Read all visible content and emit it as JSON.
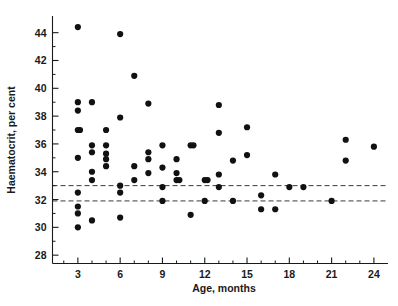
{
  "chart_data": {
    "type": "scatter",
    "title": "",
    "xlabel": "Age, months",
    "ylabel": "Haematocrit, per cent",
    "xlim": [
      1.2,
      25.0
    ],
    "ylim": [
      27.4,
      45.2
    ],
    "grid": false,
    "legend": "none",
    "xticks": [
      3,
      6,
      9,
      12,
      15,
      18,
      21,
      24
    ],
    "xticklabels": [
      "3",
      "6",
      "9",
      "12",
      "15",
      "18",
      "21",
      "24"
    ],
    "xminorticks": [
      2,
      4,
      5,
      7,
      8,
      10,
      11,
      13,
      14,
      16,
      17,
      19,
      20,
      22,
      23
    ],
    "yticks": [
      28,
      30,
      32,
      34,
      36,
      38,
      40,
      42,
      44
    ],
    "yticklabels": [
      "28",
      "30",
      "32",
      "34",
      "36",
      "38",
      "40",
      "42",
      "44"
    ],
    "yminorticks": [
      29,
      31,
      33,
      35,
      37,
      39,
      41,
      43
    ],
    "reference_lines": [
      {
        "name": "upper-reference-line",
        "y": 33.0,
        "style": "dashed"
      },
      {
        "name": "lower-reference-line",
        "y": 31.9,
        "style": "dashed"
      }
    ],
    "marker": {
      "shape": "circle",
      "color": "#111111",
      "size": 3.1
    },
    "points": [
      {
        "x": 3.0,
        "y": 44.4
      },
      {
        "x": 3.0,
        "y": 39.0
      },
      {
        "x": 3.0,
        "y": 38.4
      },
      {
        "x": 3.0,
        "y": 37.0
      },
      {
        "x": 3.15,
        "y": 37.0
      },
      {
        "x": 3.0,
        "y": 35.0
      },
      {
        "x": 3.0,
        "y": 32.5
      },
      {
        "x": 3.0,
        "y": 31.5
      },
      {
        "x": 3.0,
        "y": 31.0
      },
      {
        "x": 3.0,
        "y": 30.0
      },
      {
        "x": 4.0,
        "y": 39.0
      },
      {
        "x": 4.0,
        "y": 35.9
      },
      {
        "x": 4.0,
        "y": 35.4
      },
      {
        "x": 4.0,
        "y": 34.0
      },
      {
        "x": 4.0,
        "y": 33.4
      },
      {
        "x": 4.0,
        "y": 30.5
      },
      {
        "x": 5.0,
        "y": 37.0
      },
      {
        "x": 5.0,
        "y": 35.9
      },
      {
        "x": 5.0,
        "y": 35.3
      },
      {
        "x": 5.0,
        "y": 34.9
      },
      {
        "x": 5.0,
        "y": 34.4
      },
      {
        "x": 6.0,
        "y": 43.9
      },
      {
        "x": 6.0,
        "y": 37.9
      },
      {
        "x": 6.0,
        "y": 33.0
      },
      {
        "x": 6.0,
        "y": 32.5
      },
      {
        "x": 6.0,
        "y": 30.7
      },
      {
        "x": 7.0,
        "y": 40.9
      },
      {
        "x": 7.0,
        "y": 34.4
      },
      {
        "x": 7.0,
        "y": 33.4
      },
      {
        "x": 8.0,
        "y": 38.9
      },
      {
        "x": 8.0,
        "y": 35.4
      },
      {
        "x": 8.0,
        "y": 34.9
      },
      {
        "x": 8.0,
        "y": 33.9
      },
      {
        "x": 9.0,
        "y": 35.9
      },
      {
        "x": 9.0,
        "y": 34.3
      },
      {
        "x": 9.0,
        "y": 32.9
      },
      {
        "x": 9.0,
        "y": 31.9
      },
      {
        "x": 10.0,
        "y": 34.9
      },
      {
        "x": 10.0,
        "y": 33.9
      },
      {
        "x": 10.0,
        "y": 33.4
      },
      {
        "x": 10.2,
        "y": 33.4
      },
      {
        "x": 11.0,
        "y": 35.9
      },
      {
        "x": 11.2,
        "y": 35.9
      },
      {
        "x": 11.0,
        "y": 30.9
      },
      {
        "x": 12.0,
        "y": 33.4
      },
      {
        "x": 12.2,
        "y": 33.4
      },
      {
        "x": 12.0,
        "y": 31.9
      },
      {
        "x": 13.0,
        "y": 38.8
      },
      {
        "x": 13.0,
        "y": 36.8
      },
      {
        "x": 13.0,
        "y": 33.8
      },
      {
        "x": 13.0,
        "y": 32.9
      },
      {
        "x": 14.0,
        "y": 34.8
      },
      {
        "x": 14.0,
        "y": 31.9
      },
      {
        "x": 15.0,
        "y": 37.2
      },
      {
        "x": 15.0,
        "y": 35.2
      },
      {
        "x": 16.0,
        "y": 32.3
      },
      {
        "x": 16.0,
        "y": 31.3
      },
      {
        "x": 17.0,
        "y": 33.8
      },
      {
        "x": 17.0,
        "y": 31.3
      },
      {
        "x": 18.0,
        "y": 32.9
      },
      {
        "x": 19.0,
        "y": 32.9
      },
      {
        "x": 21.0,
        "y": 31.9
      },
      {
        "x": 22.0,
        "y": 36.3
      },
      {
        "x": 22.0,
        "y": 34.8
      },
      {
        "x": 24.0,
        "y": 35.8
      }
    ]
  }
}
